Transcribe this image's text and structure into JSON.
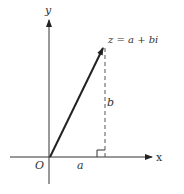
{
  "diagram": {
    "axes": {
      "x_label": "x",
      "y_label": "y",
      "origin_label": "O"
    },
    "point": {
      "label": "z = a + bi",
      "label_parts": [
        "z",
        " = ",
        "a",
        " + ",
        "b",
        "i"
      ]
    },
    "segments": {
      "horizontal_label": "a",
      "vertical_label": "b"
    },
    "colors": {
      "line": "#222222",
      "dashed": "#555555",
      "text": "#333333"
    }
  }
}
